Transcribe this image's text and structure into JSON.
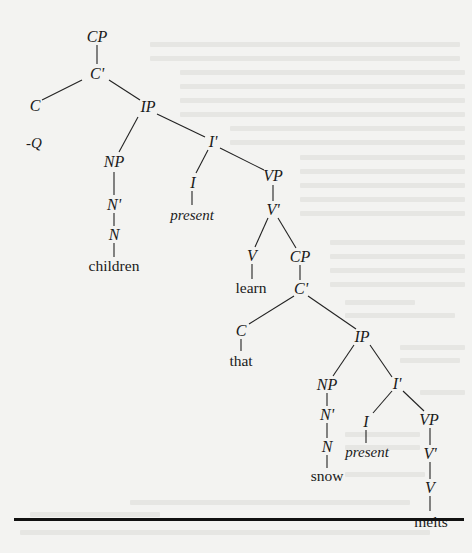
{
  "diagram": {
    "type": "syntax-tree",
    "sentence": "children learn that snow melts",
    "nodes": [
      {
        "id": "cp1",
        "label": "CP",
        "x": 97,
        "y": 37,
        "kind": "cat"
      },
      {
        "id": "c1bar",
        "label": "C'",
        "x": 97,
        "y": 74,
        "kind": "cat"
      },
      {
        "id": "c1",
        "label": "C",
        "x": 35,
        "y": 106,
        "kind": "cat"
      },
      {
        "id": "q",
        "label": "-Q",
        "x": 34,
        "y": 143,
        "kind": "feat"
      },
      {
        "id": "ip1",
        "label": "IP",
        "x": 148,
        "y": 107,
        "kind": "cat"
      },
      {
        "id": "np1",
        "label": "NP",
        "x": 114,
        "y": 162,
        "kind": "cat"
      },
      {
        "id": "n1bar",
        "label": "N'",
        "x": 114,
        "y": 205,
        "kind": "cat"
      },
      {
        "id": "n1",
        "label": "N",
        "x": 114,
        "y": 235,
        "kind": "cat"
      },
      {
        "id": "children",
        "label": "children",
        "x": 114,
        "y": 266,
        "kind": "word"
      },
      {
        "id": "i1bar",
        "label": "I'",
        "x": 213,
        "y": 142,
        "kind": "cat"
      },
      {
        "id": "i1",
        "label": "I",
        "x": 193,
        "y": 183,
        "kind": "cat"
      },
      {
        "id": "present1",
        "label": "present",
        "x": 192,
        "y": 215,
        "kind": "feat"
      },
      {
        "id": "vp1",
        "label": "VP",
        "x": 273,
        "y": 176,
        "kind": "cat"
      },
      {
        "id": "v1bar",
        "label": "V'",
        "x": 273,
        "y": 210,
        "kind": "cat"
      },
      {
        "id": "v1",
        "label": "V",
        "x": 252,
        "y": 256,
        "kind": "cat"
      },
      {
        "id": "learn",
        "label": "learn",
        "x": 251,
        "y": 288,
        "kind": "word"
      },
      {
        "id": "cp2",
        "label": "CP",
        "x": 300,
        "y": 257,
        "kind": "cat"
      },
      {
        "id": "c2bar",
        "label": "C'",
        "x": 301,
        "y": 289,
        "kind": "cat"
      },
      {
        "id": "c2",
        "label": "C",
        "x": 241,
        "y": 331,
        "kind": "cat"
      },
      {
        "id": "that",
        "label": "that",
        "x": 241,
        "y": 361,
        "kind": "word"
      },
      {
        "id": "ip2",
        "label": "IP",
        "x": 362,
        "y": 337,
        "kind": "cat"
      },
      {
        "id": "np2",
        "label": "NP",
        "x": 327,
        "y": 385,
        "kind": "cat"
      },
      {
        "id": "n2bar",
        "label": "N'",
        "x": 327,
        "y": 415,
        "kind": "cat"
      },
      {
        "id": "n2",
        "label": "N",
        "x": 327,
        "y": 447,
        "kind": "cat"
      },
      {
        "id": "snow",
        "label": "snow",
        "x": 327,
        "y": 476,
        "kind": "word"
      },
      {
        "id": "i2bar",
        "label": "I'",
        "x": 397,
        "y": 384,
        "kind": "cat"
      },
      {
        "id": "i2",
        "label": "I",
        "x": 366,
        "y": 422,
        "kind": "cat"
      },
      {
        "id": "present2",
        "label": "present",
        "x": 367,
        "y": 452,
        "kind": "feat"
      },
      {
        "id": "vp2",
        "label": "VP",
        "x": 429,
        "y": 420,
        "kind": "cat"
      },
      {
        "id": "v2bar",
        "label": "V'",
        "x": 430,
        "y": 454,
        "kind": "cat"
      },
      {
        "id": "v2",
        "label": "V",
        "x": 430,
        "y": 488,
        "kind": "cat"
      },
      {
        "id": "melts",
        "label": "melts",
        "x": 431,
        "y": 522,
        "kind": "word"
      }
    ],
    "edges": [
      [
        97,
        45,
        97,
        64
      ],
      [
        82,
        80,
        42,
        100
      ],
      [
        109,
        80,
        140,
        100
      ],
      [
        138,
        117,
        119,
        152
      ],
      [
        157,
        114,
        205,
        137
      ],
      [
        114,
        172,
        114,
        195
      ],
      [
        114,
        213,
        114,
        226
      ],
      [
        114,
        243,
        114,
        257
      ],
      [
        208,
        150,
        196,
        173
      ],
      [
        220,
        148,
        264,
        170
      ],
      [
        192,
        191,
        192,
        205
      ],
      [
        273,
        185,
        273,
        201
      ],
      [
        268,
        218,
        255,
        247
      ],
      [
        278,
        218,
        296,
        248
      ],
      [
        252,
        264,
        252,
        279
      ],
      [
        300,
        265,
        300,
        280
      ],
      [
        294,
        296,
        249,
        324
      ],
      [
        308,
        296,
        356,
        329
      ],
      [
        241,
        339,
        241,
        351
      ],
      [
        354,
        345,
        333,
        376
      ],
      [
        370,
        345,
        392,
        377
      ],
      [
        327,
        393,
        327,
        406
      ],
      [
        327,
        423,
        327,
        438
      ],
      [
        327,
        455,
        327,
        468
      ],
      [
        392,
        391,
        373,
        413
      ],
      [
        403,
        391,
        424,
        411
      ],
      [
        366,
        430,
        366,
        443
      ],
      [
        430,
        428,
        430,
        445
      ],
      [
        430,
        462,
        430,
        479
      ],
      [
        430,
        496,
        430,
        511
      ]
    ],
    "line_color": "#222222",
    "rule_color": "#111111"
  }
}
